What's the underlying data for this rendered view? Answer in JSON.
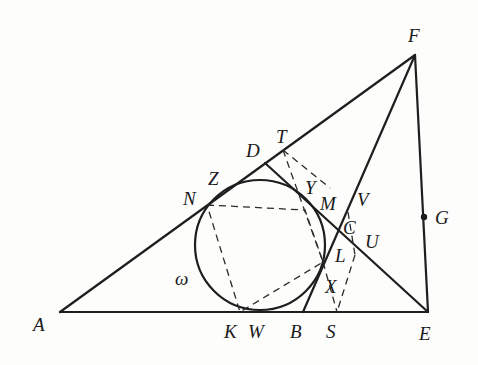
{
  "figure": {
    "type": "geometry-diagram",
    "circle_label": "ω",
    "points": {
      "A": {
        "label": "A",
        "x": 60,
        "y": 312
      },
      "E": {
        "label": "E",
        "x": 428,
        "y": 312
      },
      "F": {
        "label": "F",
        "x": 415,
        "y": 55
      },
      "D": {
        "label": "D",
        "x": 265,
        "y": 163
      },
      "T": {
        "label": "T",
        "x": 283,
        "y": 150
      },
      "Z": {
        "label": "Z"
      },
      "N": {
        "label": "N",
        "x": 207,
        "y": 205
      },
      "Y": {
        "label": "Y",
        "x": 295,
        "y": 190
      },
      "M": {
        "label": "M",
        "x": 330,
        "y": 205
      },
      "V": {
        "label": "V",
        "x": 350,
        "y": 210
      },
      "C": {
        "label": "C",
        "x": 340,
        "y": 229
      },
      "U": {
        "label": "U",
        "x": 358,
        "y": 245
      },
      "G": {
        "label": "G",
        "x": 424,
        "y": 217
      },
      "L": {
        "label": "L",
        "x": 323,
        "y": 262
      },
      "X": {
        "label": "X",
        "x": 330,
        "y": 285
      },
      "K": {
        "label": "K",
        "x": 240,
        "y": 312
      },
      "W": {
        "label": "W",
        "x": 265,
        "y": 312
      },
      "B": {
        "label": "B",
        "x": 303,
        "y": 312
      },
      "S": {
        "label": "S",
        "x": 337,
        "y": 312
      }
    },
    "circle": {
      "name": "ω",
      "cx": 260,
      "cy": 245,
      "r": 65
    }
  }
}
